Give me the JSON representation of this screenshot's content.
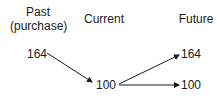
{
  "columns": {
    "past": {
      "title": "Past",
      "subtitle": "(purchase)",
      "value": "164"
    },
    "current": {
      "title": "Current",
      "value": "100"
    },
    "future": {
      "title": "Future",
      "values": [
        "164",
        "100"
      ]
    }
  },
  "arrows": [
    {
      "from": "past.164",
      "to": "current.100"
    },
    {
      "from": "current.100",
      "to": "future.164"
    },
    {
      "from": "current.100",
      "to": "future.100"
    }
  ],
  "colors": {
    "ink": "#1a1a1a",
    "background": "#ffffff"
  }
}
